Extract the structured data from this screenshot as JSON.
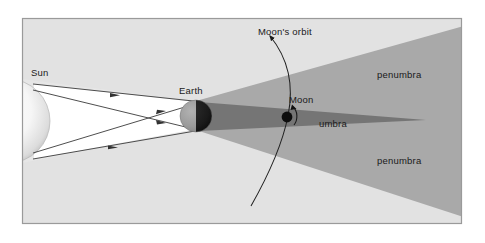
{
  "figure": {
    "frame": {
      "border_color": "#9a9a9a",
      "background_color": "#e2e2e2",
      "x": 22,
      "y": 18,
      "width": 440,
      "height": 206
    }
  },
  "colors": {
    "background": "#e2e2e2",
    "sunlit_cone": "#ffffff",
    "penumbra": "#a9a9a9",
    "umbra": "#757575",
    "earth_lit": "#9b9b9b",
    "earth_dark": "#1f1f1f",
    "sun_body": "#f2f2f2",
    "ray_line": "#3a3a3a",
    "orbit_line": "#222222",
    "moon": "#0d0d0d",
    "border": "#9a9a9a",
    "label_text": "#1a1a1a"
  },
  "labels": {
    "sun": "Sun",
    "earth": "Earth",
    "moon": "Moon",
    "moons_orbit": "Moon's orbit",
    "umbra": "umbra",
    "penumbra_upper": "penumbra",
    "penumbra_lower": "penumbra"
  },
  "bodies": {
    "sun": {
      "name": "Sun",
      "cx": 10,
      "cy": 121,
      "r": 42,
      "clipped_by_left_edge": true
    },
    "earth": {
      "name": "Earth",
      "cx": 196,
      "cy": 115,
      "r": 14,
      "lit_side": "left",
      "dark_side": "right"
    },
    "moon": {
      "name": "Moon",
      "cx": 286,
      "cy": 117,
      "r": 5,
      "inside_shadow": "umbra"
    }
  },
  "shadow": {
    "umbra": {
      "apex_x": 426,
      "apex_y": 120,
      "base_top_y": 102,
      "base_bottom_y": 131,
      "base_x": 203
    },
    "penumbra": {
      "diverging": true,
      "right_edge_top_y": 28,
      "right_edge_bottom_y": 214
    }
  },
  "rays": {
    "count": 4,
    "description": "Straight light rays drawn from the Sun's limbs tangent to the Earth, with arrowheads indicating direction of travel toward the Earth",
    "arrow_direction": "left-to-right"
  },
  "orbit": {
    "description": "Curved arc representing the Moon's orbital path, arrowhead at upper end indicating direction of motion",
    "arrow_at": "top"
  }
}
